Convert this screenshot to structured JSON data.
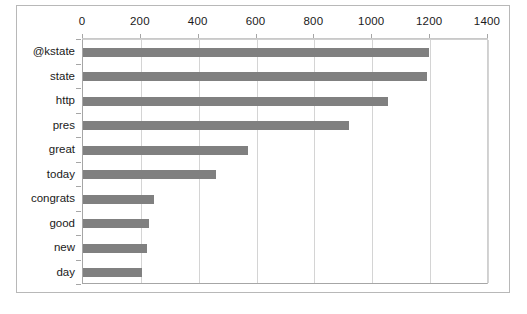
{
  "chart_data": {
    "type": "bar",
    "orientation": "horizontal",
    "title": "",
    "xlabel": "",
    "ylabel": "",
    "categories": [
      "@kstate",
      "state",
      "http",
      "pres",
      "great",
      "today",
      "congrats",
      "good",
      "new",
      "day"
    ],
    "values": [
      1195,
      1190,
      1055,
      918,
      570,
      460,
      244,
      227,
      222,
      203
    ],
    "series": [
      {
        "name": "Frequency",
        "values": [
          1195,
          1190,
          1055,
          918,
          570,
          460,
          244,
          227,
          222,
          203
        ]
      }
    ],
    "xlim": [
      0,
      1400
    ],
    "xticks": [
      0,
      200,
      400,
      600,
      800,
      1000,
      1200,
      1400
    ],
    "xtick_labels": [
      "0",
      "200",
      "400",
      "600",
      "800",
      "1000",
      "1200",
      "1400"
    ],
    "grid": true,
    "grid_axis": "x",
    "legend": false,
    "legend_position": "none",
    "bar_color": "#808080",
    "gridline_color": "#d4d4d4",
    "axis_color": "#a6a6a6",
    "plot_background": "#ffffff",
    "frame_border_color": "#b8b8b8"
  }
}
